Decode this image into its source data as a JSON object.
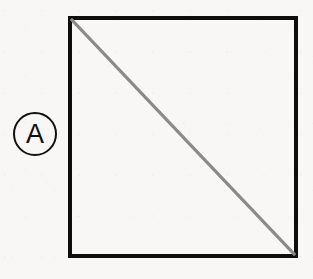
{
  "figure": {
    "background_color": "#f8f7f5",
    "paper_texture": "light-scan-noise",
    "reference_label": {
      "text": "A",
      "shape": "circle",
      "stroke_color": "#111111",
      "diameter_px": 44,
      "center_x": 35,
      "center_y": 134
    },
    "square": {
      "stroke_color": "#0d0d0d",
      "stroke_width_px": 4,
      "left": 68,
      "top": 16,
      "width": 230,
      "height": 242,
      "fill": "none"
    },
    "diagonal": {
      "stroke_color": "#8a8a8a",
      "stroke_width_px": 3,
      "from": "top-left",
      "to": "bottom-right",
      "x1": 0,
      "y1": 0,
      "x2": 230,
      "y2": 242
    }
  }
}
